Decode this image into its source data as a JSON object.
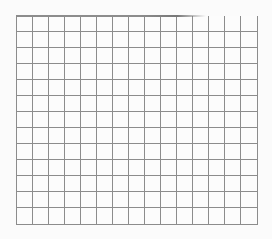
{
  "paper": {
    "type": "graph-paper",
    "columns": 15,
    "rows": 13,
    "cell_size_px": 16,
    "line_color": "#8c8c8c",
    "background_color": "#fbfbfb"
  }
}
